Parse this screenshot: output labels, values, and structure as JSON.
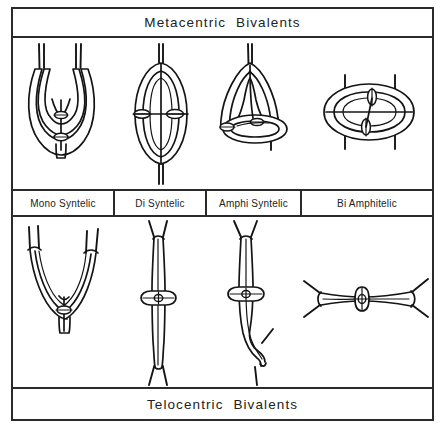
{
  "figure": {
    "top_title": "Metacentric  Bivalents",
    "bottom_title": "Telocentric  Bivalents",
    "border_color": "#2a2a2a",
    "ink_color": "#141414",
    "background": "#ffffff"
  },
  "columns": [
    {
      "key": "mono",
      "label": "Mono Syntelic"
    },
    {
      "key": "di",
      "label": "Di Syntelic"
    },
    {
      "key": "amphi",
      "label": "Amphi Syntelic"
    },
    {
      "key": "bi",
      "label": "Bi Amphitelic"
    }
  ],
  "top_row": {
    "title_ref": "Metacentric Bivalents",
    "cells": [
      {
        "name": "metacentric-mono-syntelic",
        "shape": "u-shaped bivalent, two arms curving up, paired spindle fibers at both arm tips pointing up",
        "fiber_count": 4,
        "fiber_direction": "up"
      },
      {
        "name": "metacentric-di-syntelic",
        "shape": "vertical closed ring with two lateral centromere knots, single fiber bundle up and single fiber bundle down",
        "fiber_count": 2,
        "fiber_direction": "up-and-down"
      },
      {
        "name": "metacentric-amphi-syntelic",
        "shape": "vertical loop above joined to horizontal ellipse below, fiber up from loop apex and fiber down through ellipse",
        "fiber_count": 2,
        "fiber_direction": "up-and-down"
      },
      {
        "name": "metacentric-bi-amphitelic",
        "shape": "horizontal ring with two centromere knots, two vertical fibers passing through left and right",
        "fiber_count": 4,
        "fiber_direction": "up-and-down"
      }
    ]
  },
  "bottom_row": {
    "title_ref": "Telocentric Bivalents",
    "cells": [
      {
        "name": "telocentric-mono-syntelic",
        "shape": "wide V-shaped bivalent with four spindle fibers at the two upper tips",
        "fiber_count": 4,
        "fiber_direction": "up"
      },
      {
        "name": "telocentric-di-syntelic",
        "shape": "straight vertical rod with central chiasma knot, splayed fibers at top and bottom",
        "fiber_count": 4,
        "fiber_direction": "up-and-down"
      },
      {
        "name": "telocentric-amphi-syntelic",
        "shape": "vertical rod with central chiasma knot, lower end hooking to the right with fibers",
        "fiber_count": 4,
        "fiber_direction": "up-and-down"
      },
      {
        "name": "telocentric-bi-amphitelic",
        "shape": "horizontal rod with central chiasma knot, splayed fibers at both left and right ends",
        "fiber_count": 4,
        "fiber_direction": "left-and-right"
      }
    ]
  }
}
